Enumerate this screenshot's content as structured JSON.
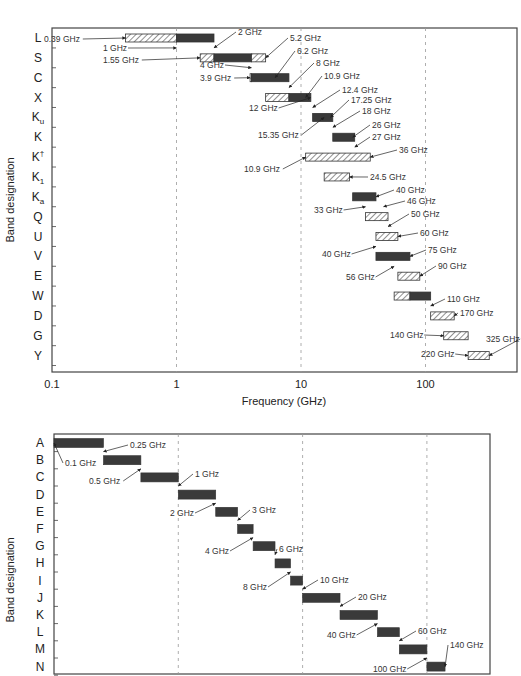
{
  "chart_data": [
    {
      "type": "bar",
      "subtype": "horizontal-range (log x)",
      "title": "",
      "xlabel": "Frequency (GHz)",
      "ylabel": "Band designation",
      "xscale": "log",
      "xlim": [
        0.1,
        500
      ],
      "x_ticks": [
        "0.1",
        "1",
        "10",
        "100"
      ],
      "grid": "vertical dashed at 1, 10, 100",
      "legend": "hatched = extended range, solid = core range",
      "categories": [
        "L",
        "S",
        "C",
        "X",
        "Ku",
        "K",
        "K†",
        "K1",
        "Ka",
        "Q",
        "U",
        "V",
        "E",
        "W",
        "D",
        "G",
        "Y"
      ],
      "category_display": [
        {
          "base": "L",
          "sub": "",
          "sup": ""
        },
        {
          "base": "S",
          "sub": "",
          "sup": ""
        },
        {
          "base": "C",
          "sub": "",
          "sup": ""
        },
        {
          "base": "X",
          "sub": "",
          "sup": ""
        },
        {
          "base": "K",
          "sub": "u",
          "sup": ""
        },
        {
          "base": "K",
          "sub": "",
          "sup": ""
        },
        {
          "base": "K",
          "sub": "",
          "sup": "†"
        },
        {
          "base": "K",
          "sub": "1",
          "sup": ""
        },
        {
          "base": "K",
          "sub": "a",
          "sup": ""
        },
        {
          "base": "Q",
          "sub": "",
          "sup": ""
        },
        {
          "base": "U",
          "sub": "",
          "sup": ""
        },
        {
          "base": "V",
          "sub": "",
          "sup": ""
        },
        {
          "base": "E",
          "sub": "",
          "sup": ""
        },
        {
          "base": "W",
          "sub": "",
          "sup": ""
        },
        {
          "base": "D",
          "sub": "",
          "sup": ""
        },
        {
          "base": "G",
          "sub": "",
          "sup": ""
        },
        {
          "base": "Y",
          "sub": "",
          "sup": ""
        }
      ],
      "bands": [
        {
          "band": "L",
          "segments": [
            {
              "from": 0.39,
              "to": 1,
              "style": "hatch"
            },
            {
              "from": 1,
              "to": 2,
              "style": "solid"
            }
          ]
        },
        {
          "band": "S",
          "segments": [
            {
              "from": 1.55,
              "to": 2,
              "style": "hatch"
            },
            {
              "from": 2,
              "to": 4,
              "style": "solid"
            },
            {
              "from": 4,
              "to": 5.2,
              "style": "hatch"
            }
          ]
        },
        {
          "band": "C",
          "segments": [
            {
              "from": 3.9,
              "to": 4,
              "style": "hatch"
            },
            {
              "from": 4,
              "to": 8,
              "style": "solid"
            }
          ]
        },
        {
          "band": "X",
          "segments": [
            {
              "from": 5.2,
              "to": 8,
              "style": "hatch"
            },
            {
              "from": 8,
              "to": 12,
              "style": "solid"
            }
          ]
        },
        {
          "band": "Ku",
          "segments": [
            {
              "from": 12.4,
              "to": 18,
              "style": "solid"
            }
          ]
        },
        {
          "band": "K",
          "segments": [
            {
              "from": 18,
              "to": 27,
              "style": "solid"
            }
          ]
        },
        {
          "band": "K†",
          "segments": [
            {
              "from": 10.9,
              "to": 36,
              "style": "hatch"
            }
          ]
        },
        {
          "band": "K1",
          "segments": [
            {
              "from": 15.35,
              "to": 24.5,
              "style": "hatch"
            }
          ]
        },
        {
          "band": "Ka",
          "segments": [
            {
              "from": 26,
              "to": 40,
              "style": "solid"
            }
          ]
        },
        {
          "band": "Q",
          "segments": [
            {
              "from": 33,
              "to": 50,
              "style": "hatch"
            }
          ]
        },
        {
          "band": "U",
          "segments": [
            {
              "from": 40,
              "to": 60,
              "style": "hatch"
            }
          ]
        },
        {
          "band": "V",
          "segments": [
            {
              "from": 40,
              "to": 75,
              "style": "solid"
            }
          ]
        },
        {
          "band": "E",
          "segments": [
            {
              "from": 60,
              "to": 90,
              "style": "hatch"
            }
          ]
        },
        {
          "band": "W",
          "segments": [
            {
              "from": 56,
              "to": 75,
              "style": "hatch"
            },
            {
              "from": 75,
              "to": 110,
              "style": "solid"
            }
          ]
        },
        {
          "band": "D",
          "segments": [
            {
              "from": 110,
              "to": 170,
              "style": "hatch"
            }
          ]
        },
        {
          "band": "G",
          "segments": [
            {
              "from": 140,
              "to": 220,
              "style": "hatch"
            }
          ]
        },
        {
          "band": "Y",
          "segments": [
            {
              "from": 220,
              "to": 325,
              "style": "hatch"
            }
          ]
        }
      ],
      "annotations": [
        "0.39 GHz",
        "1 GHz",
        "2 GHz",
        "1.55 GHz",
        "5.2 GHz",
        "4 GHz",
        "6.2 GHz",
        "8 GHz",
        "3.9 GHz",
        "10.9 GHz",
        "12.4 GHz",
        "12 GHz",
        "17.25 GHz",
        "18 GHz",
        "15.35 GHz",
        "26 GHz",
        "27 GHz",
        "36 GHz",
        "10.9 GHz",
        "24.5 GHz",
        "40 GHz",
        "33 GHz",
        "46 GHz",
        "50 GHz",
        "60 GHz",
        "40 GHz",
        "75 GHz",
        "56 GHz",
        "90 GHz",
        "110 GHz",
        "170 GHz",
        "140 GHz",
        "325 GHz",
        "220 GHz"
      ]
    },
    {
      "type": "bar",
      "subtype": "horizontal-range (log x)",
      "title": "",
      "xlabel": "",
      "ylabel": "Band designation",
      "xscale": "log",
      "xlim": [
        0.1,
        500
      ],
      "grid": "vertical dashed at 1, 10, 100",
      "categories": [
        "A",
        "B",
        "C",
        "D",
        "E",
        "F",
        "G",
        "H",
        "I",
        "J",
        "K",
        "L",
        "M",
        "N"
      ],
      "bands": [
        {
          "band": "A",
          "from": 0.1,
          "to": 0.25
        },
        {
          "band": "B",
          "from": 0.25,
          "to": 0.5
        },
        {
          "band": "C",
          "from": 0.5,
          "to": 1
        },
        {
          "band": "D",
          "from": 1,
          "to": 2
        },
        {
          "band": "E",
          "from": 2,
          "to": 3
        },
        {
          "band": "F",
          "from": 3,
          "to": 4
        },
        {
          "band": "G",
          "from": 4,
          "to": 6
        },
        {
          "band": "H",
          "from": 6,
          "to": 8
        },
        {
          "band": "I",
          "from": 8,
          "to": 10
        },
        {
          "band": "J",
          "from": 10,
          "to": 20
        },
        {
          "band": "K",
          "from": 20,
          "to": 40
        },
        {
          "band": "L",
          "from": 40,
          "to": 60
        },
        {
          "band": "M",
          "from": 60,
          "to": 100
        },
        {
          "band": "N",
          "from": 100,
          "to": 140
        }
      ],
      "annotations": [
        "0.25 GHz",
        "0.1 GHz",
        "0.5 GHz",
        "1 GHz",
        "2 GHz",
        "3 GHz",
        "4 GHz",
        "6 GHz",
        "8 GHz",
        "10 GHz",
        "20 GHz",
        "40 GHz",
        "60 GHz",
        "100 GHz",
        "140 GHz"
      ]
    }
  ],
  "top": {
    "ylabel": "Band designation",
    "xlabel": "Frequency (GHz)",
    "ticks": [
      "0.1",
      "1",
      "10",
      "100"
    ]
  },
  "bottom": {
    "ylabel": "Band designation"
  },
  "colors": {
    "solid": "#3a3a3a",
    "hatch": "#555555",
    "frame": "#444444",
    "grid": "#999999"
  }
}
